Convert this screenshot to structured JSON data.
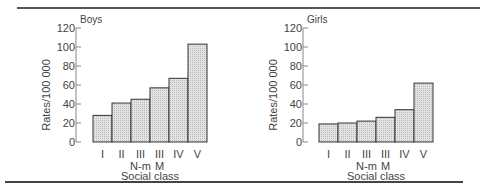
{
  "chart_data": [
    {
      "type": "bar",
      "title": "Boys",
      "xlabel": "Social class",
      "ylabel": "Rates/100 000",
      "ylim": [
        0,
        120
      ],
      "yticks": [
        0,
        20,
        40,
        60,
        80,
        100,
        120
      ],
      "grid": false,
      "categories": [
        "I",
        "II",
        "III N-m",
        "III M",
        "IV",
        "V"
      ],
      "category_lines": [
        [
          "I",
          ""
        ],
        [
          "II",
          ""
        ],
        [
          "III",
          "N-m"
        ],
        [
          "III",
          "M"
        ],
        [
          "IV",
          ""
        ],
        [
          "V",
          ""
        ]
      ],
      "values": [
        28,
        41,
        45,
        57,
        67,
        103
      ]
    },
    {
      "type": "bar",
      "title": "Girls",
      "xlabel": "Social class",
      "ylabel": "Rates/100 000",
      "ylim": [
        0,
        120
      ],
      "yticks": [
        0,
        20,
        40,
        60,
        80,
        100,
        120
      ],
      "grid": false,
      "categories": [
        "I",
        "II",
        "III N-m",
        "III M",
        "IV",
        "V"
      ],
      "category_lines": [
        [
          "I",
          ""
        ],
        [
          "II",
          ""
        ],
        [
          "III",
          "N-m"
        ],
        [
          "III",
          "M"
        ],
        [
          "IV",
          ""
        ],
        [
          "V",
          ""
        ]
      ],
      "values": [
        19,
        20,
        22,
        26,
        34,
        62
      ]
    }
  ],
  "colors": {
    "bar_fill": "#d8d8d8",
    "bar_stroke": "#333333",
    "axis": "#888888",
    "text": "#444444"
  }
}
